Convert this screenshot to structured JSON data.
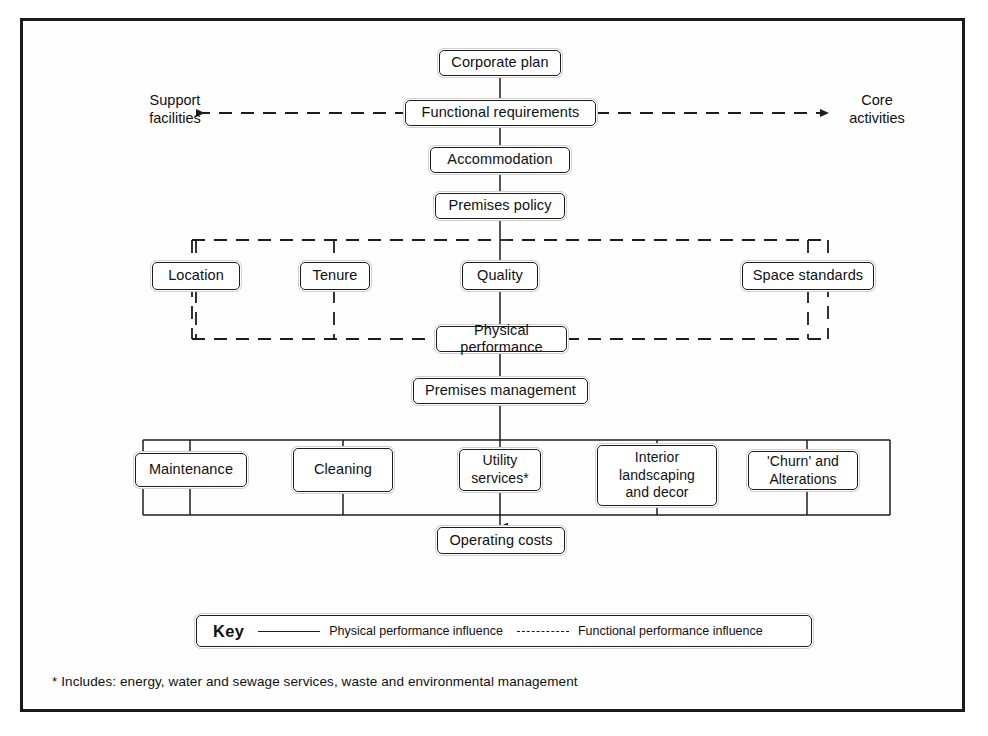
{
  "diagram": {
    "colors": {
      "ink": "#1d1d1d",
      "paper": "#ffffff",
      "frame": "#1a1a1a"
    },
    "nodes": {
      "corporate_plan": "Corporate plan",
      "functional_requirements": "Functional requirements",
      "accommodation": "Accommodation",
      "premises_policy": "Premises policy",
      "location": "Location",
      "tenure": "Tenure",
      "quality": "Quality",
      "space_standards": "Space standards",
      "physical_performance": "Physical performance",
      "premises_management": "Premises management",
      "maintenance": "Maintenance",
      "cleaning": "Cleaning",
      "utility_services": "Utility\nservices*",
      "utility_services_line1": "Utility",
      "utility_services_line2": "services*",
      "interior_landscaping_line1": "Interior",
      "interior_landscaping_line2": "landscaping",
      "interior_landscaping_line3": "and decor",
      "churn_line1": "'Churn' and",
      "churn_line2": "Alterations",
      "operating_costs": "Operating costs"
    },
    "side_labels": {
      "left_line1": "Support",
      "left_line2": "facilities",
      "right_line1": "Core",
      "right_line2": "activities"
    },
    "key": {
      "label": "Key",
      "solid_entry": "Physical performance influence",
      "dashed_entry": "Functional performance influence"
    },
    "footnote": "* Includes: energy, water and sewage services, waste and environmental management"
  }
}
